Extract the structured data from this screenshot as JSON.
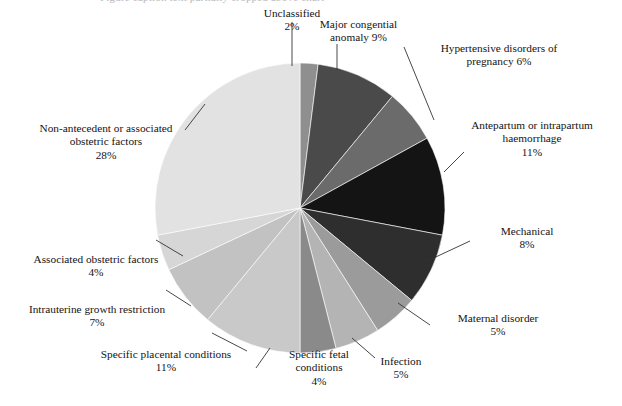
{
  "cropped_caption_top": "Figure caption text partially cropped above chart",
  "chart_data": {
    "type": "pie",
    "title": "",
    "start_angle_deg": 0,
    "direction": "clockwise",
    "center": {
      "x": 300,
      "y": 208
    },
    "radius": 145,
    "legend_position": "callout-labels",
    "grid": false,
    "categories": [
      "Unclassified",
      "Major congenital anomaly",
      "Hypertensive disorders of pregnancy",
      "Antepartum or intrapartum haemorrhage",
      "Mechanical",
      "Maternal disorder",
      "Infection",
      "Specific fetal conditions",
      "Specific placental conditions",
      "Intrauterine growth restriction",
      "Associated obstetric factors",
      "Non-antecedent or associated obstetric factors"
    ],
    "values": [
      2,
      9,
      6,
      11,
      8,
      5,
      5,
      4,
      11,
      7,
      4,
      28
    ],
    "unit": "%",
    "colors": [
      "#8f8f8f",
      "#4a4a4a",
      "#6b6b6b",
      "#141414",
      "#2e2e2e",
      "#9b9b9b",
      "#b4b4b4",
      "#8a8a8a",
      "#c9c9c9",
      "#c2c2c2",
      "#d6d6d6",
      "#e2e2e2"
    ]
  },
  "labels": [
    {
      "id": "unclassified",
      "name": "Unclassified",
      "value": "2%",
      "text": "Unclassified\n2%"
    },
    {
      "id": "major-anomaly",
      "name": "Major congenital anomaly",
      "value": "9%",
      "text": "Major congential\nanomaly 9%"
    },
    {
      "id": "hypertensive",
      "name": "Hypertensive disorders of pregnancy",
      "value": "6%",
      "text": "Hypertensive disorders of\npregnancy 6%"
    },
    {
      "id": "haemorrhage",
      "name": "Antepartum or intrapartum haemorrhage",
      "value": "11%",
      "text": "Antepartum or intrapartum\nhaemorrhage\n11%"
    },
    {
      "id": "mechanical",
      "name": "Mechanical",
      "value": "8%",
      "text": "Mechanical\n8%"
    },
    {
      "id": "maternal",
      "name": "Maternal disorder",
      "value": "5%",
      "text": "Maternal disorder\n5%"
    },
    {
      "id": "infection",
      "name": "Infection",
      "value": "5%",
      "text": "Infection\n5%"
    },
    {
      "id": "fetal",
      "name": "Specific fetal conditions",
      "value": "4%",
      "text": "Specific fetal\nconditions\n4%"
    },
    {
      "id": "placental",
      "name": "Specific placental conditions",
      "value": "11%",
      "text": "Specific placental conditions\n11%"
    },
    {
      "id": "iugr",
      "name": "Intrauterine growth restriction",
      "value": "7%",
      "text": "Intrauterine growth restriction\n7%"
    },
    {
      "id": "assoc-obs",
      "name": "Associated obstetric factors",
      "value": "4%",
      "text": "Associated obstetric factors\n4%"
    },
    {
      "id": "non-antecedent",
      "name": "Non-antecedent or associated obstetric factors",
      "value": "28%",
      "text": "Non-antecedent or associated\nobstetric factors\n28%"
    }
  ]
}
